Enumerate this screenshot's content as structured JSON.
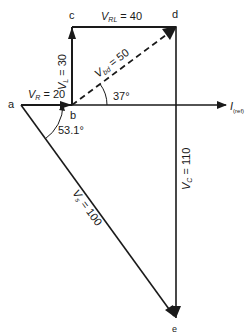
{
  "diagram": {
    "type": "phasor-diagram",
    "points": {
      "a": {
        "label": "a",
        "x": 21,
        "y": 105
      },
      "b": {
        "label": "b",
        "x": 72,
        "y": 105
      },
      "c": {
        "label": "c",
        "x": 72,
        "y": 27
      },
      "d": {
        "label": "d",
        "x": 176,
        "y": 27
      },
      "e": {
        "label": "e",
        "x": 176,
        "y": 318
      }
    },
    "vectors": [
      {
        "name": "VR",
        "label_main": "V",
        "label_sub": "R",
        "value_text": "= 20",
        "from": "a",
        "to": "b"
      },
      {
        "name": "VL",
        "label_main": "V",
        "label_sub": "L",
        "value_text": "= 30",
        "from": "b",
        "to": "c"
      },
      {
        "name": "VRL",
        "label_main": "V",
        "label_sub": "RL",
        "value_text": "= 40",
        "from": "c",
        "to": "d"
      },
      {
        "name": "Vbd",
        "label_main": "V",
        "label_sub": "bd",
        "value_text": "= 50",
        "from": "b",
        "to": "d",
        "dashed": true
      },
      {
        "name": "VC",
        "label_main": "V",
        "label_sub": "C",
        "value_text": "= 110",
        "from": "d",
        "to": "e"
      },
      {
        "name": "Vs",
        "label_main": "V",
        "label_sub": "s",
        "value_text": "= 100",
        "from": "a",
        "to": "e"
      }
    ],
    "angles": [
      {
        "label": "37°"
      },
      {
        "label": "53.1°"
      }
    ],
    "reference_axis": {
      "label_main": "I",
      "label_sub": "(ref)"
    }
  }
}
